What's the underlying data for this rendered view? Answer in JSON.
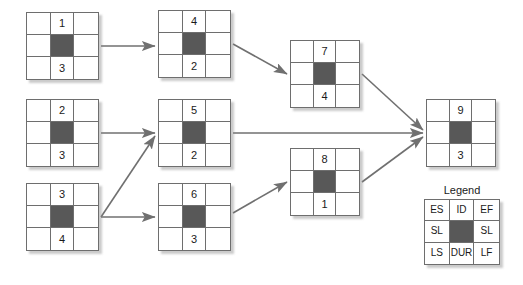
{
  "diagram": {
    "title": "",
    "type": "activity-on-node-network",
    "node_cell_layout": {
      "top_left": "ES",
      "top_center": "ID",
      "top_right": "EF",
      "middle_left": "SL",
      "middle_center": "filled",
      "middle_right": "SL",
      "bottom_left": "LS",
      "bottom_center": "DUR",
      "bottom_right": "LF"
    },
    "colors": {
      "node_fill": "#ffffff",
      "node_border": "#6e6e6e",
      "center_block": "#585858",
      "arrow": "#707070",
      "text": "#1a1a1a",
      "shadow": "#8c8c8c",
      "background": "#ffffff"
    },
    "nodes": [
      {
        "key": "n1",
        "id": "1",
        "dur": "3",
        "x": 26,
        "y": 12,
        "w": 73,
        "h": 68
      },
      {
        "key": "n2",
        "id": "2",
        "dur": "3",
        "x": 26,
        "y": 99,
        "w": 73,
        "h": 68
      },
      {
        "key": "n3",
        "id": "3",
        "dur": "4",
        "x": 26,
        "y": 183,
        "w": 73,
        "h": 68
      },
      {
        "key": "n4",
        "id": "4",
        "dur": "2",
        "x": 158,
        "y": 10,
        "w": 73,
        "h": 68
      },
      {
        "key": "n5",
        "id": "5",
        "dur": "2",
        "x": 158,
        "y": 99,
        "w": 73,
        "h": 68
      },
      {
        "key": "n6",
        "id": "6",
        "dur": "3",
        "x": 158,
        "y": 183,
        "w": 73,
        "h": 68
      },
      {
        "key": "n7",
        "id": "7",
        "dur": "4",
        "x": 290,
        "y": 40,
        "w": 70,
        "h": 68
      },
      {
        "key": "n8",
        "id": "8",
        "dur": "1",
        "x": 290,
        "y": 148,
        "w": 70,
        "h": 68
      },
      {
        "key": "n9",
        "id": "9",
        "dur": "3",
        "x": 426,
        "y": 99,
        "w": 70,
        "h": 68
      }
    ],
    "edges": [
      {
        "from": "1",
        "to": "4",
        "x1": 101,
        "y1": 46,
        "x2": 155,
        "y2": 46
      },
      {
        "from": "4",
        "to": "7",
        "x1": 233,
        "y1": 44,
        "x2": 287,
        "y2": 74
      },
      {
        "from": "2",
        "to": "5",
        "x1": 101,
        "y1": 133,
        "x2": 155,
        "y2": 133
      },
      {
        "from": "3",
        "to": "5",
        "x1": 101,
        "y1": 217,
        "x2": 155,
        "y2": 136
      },
      {
        "from": "3",
        "to": "6",
        "x1": 101,
        "y1": 217,
        "x2": 155,
        "y2": 217
      },
      {
        "from": "5",
        "to": "9",
        "x1": 233,
        "y1": 133,
        "x2": 423,
        "y2": 133
      },
      {
        "from": "6",
        "to": "8",
        "x1": 233,
        "y1": 213,
        "x2": 287,
        "y2": 182
      },
      {
        "from": "7",
        "to": "9",
        "x1": 362,
        "y1": 74,
        "x2": 423,
        "y2": 130
      },
      {
        "from": "8",
        "to": "9",
        "x1": 362,
        "y1": 182,
        "x2": 423,
        "y2": 137
      }
    ],
    "legend": {
      "title": "Legend",
      "x": 424,
      "y": 185,
      "cells": [
        "ES",
        "ID",
        "EF",
        "SL",
        "",
        "SL",
        "LS",
        "DUR",
        "LF"
      ]
    }
  }
}
